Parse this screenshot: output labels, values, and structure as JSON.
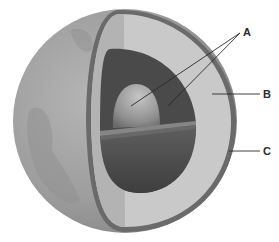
{
  "diagram": {
    "labels": [
      {
        "id": "A",
        "text": "A",
        "x": 243,
        "y": 27,
        "targets": "inner core and outer core"
      },
      {
        "id": "B",
        "text": "B",
        "x": 263,
        "y": 89,
        "targets": "mantle"
      },
      {
        "id": "C",
        "text": "C",
        "x": 263,
        "y": 146,
        "targets": "crust"
      }
    ],
    "colors": {
      "background": "#ffffff",
      "surface": "#9a9a9a",
      "surface_light": "#b8b8b8",
      "crust": "#6a6a6a",
      "mantle_lit": "#d0d0d0",
      "mantle_shadow": "#b4b4b4",
      "outer_core": "#4a4a4a",
      "outer_core_lower": "#555555",
      "inner_core": "#9c9c9c",
      "slice": "#808080",
      "leader_line": "#2a2a2a"
    }
  }
}
